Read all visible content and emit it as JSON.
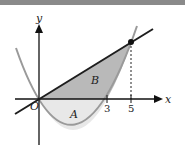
{
  "diagram": {
    "axis_labels": {
      "x": "x",
      "y": "y",
      "origin": "O"
    },
    "tick_labels": [
      "3",
      "5"
    ],
    "region_labels": {
      "A": "A",
      "B": "B"
    },
    "colors": {
      "region_A": "#e6e6e6",
      "region_B": "#b8b8b8",
      "curve": "#9a9a9a",
      "line": "#1e1e1e",
      "axis": "#111111",
      "topbar": "#8a8a8a"
    }
  }
}
